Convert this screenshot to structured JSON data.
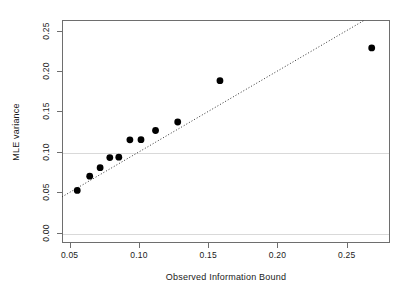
{
  "chart_data": {
    "type": "scatter",
    "title": "",
    "xlabel": "Observed Information Bound",
    "ylabel": "MLE variance",
    "xlim": [
      0.0445,
      0.2812
    ],
    "ylim": [
      -0.0125,
      0.263
    ],
    "xticks": [
      0.05,
      0.1,
      0.15,
      0.2,
      0.25
    ],
    "xticklabels": [
      "0.05",
      "0.10",
      "0.15",
      "0.20",
      "0.25"
    ],
    "yticks": [
      0.0,
      0.05,
      0.1,
      0.15,
      0.2,
      0.25
    ],
    "yticklabels": [
      "0.00",
      "0.05",
      "0.10",
      "0.15",
      "0.20",
      "0.25"
    ],
    "grid": true,
    "gridlines_y": [
      0.0,
      0.1
    ],
    "grid_color": "#d9d9d9",
    "legend": null,
    "point_color": "#000000",
    "point_size": 3.4,
    "points": [
      {
        "x": 0.0555,
        "y": 0.0525
      },
      {
        "x": 0.0645,
        "y": 0.07
      },
      {
        "x": 0.072,
        "y": 0.0805
      },
      {
        "x": 0.079,
        "y": 0.093
      },
      {
        "x": 0.0855,
        "y": 0.0935
      },
      {
        "x": 0.0935,
        "y": 0.115
      },
      {
        "x": 0.1015,
        "y": 0.1152
      },
      {
        "x": 0.112,
        "y": 0.1265
      },
      {
        "x": 0.128,
        "y": 0.137
      },
      {
        "x": 0.1585,
        "y": 0.188
      },
      {
        "x": 0.268,
        "y": 0.2285
      }
    ],
    "reference_line": {
      "name": "identity-line",
      "style": "dotted",
      "color": "#333333",
      "slope": 1,
      "intercept": 0,
      "x_start": 0.0445,
      "x_end": 0.263
    }
  }
}
